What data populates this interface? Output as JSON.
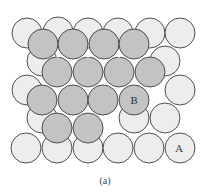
{
  "figure": {
    "caption": "(a)",
    "colors": {
      "layer_a_fill": "#ededed",
      "layer_b_fill": "#c3c3c3",
      "stroke": "#3c3c3c",
      "hole": "#ffffff"
    },
    "radius": 15,
    "layer_a": {
      "name": "Layer A (bottom, light)",
      "circles": [
        [
          27,
          33
        ],
        [
          58,
          32
        ],
        [
          88,
          33
        ],
        [
          118,
          33
        ],
        [
          150,
          33
        ],
        [
          180,
          33
        ],
        [
          42,
          61
        ],
        [
          165,
          61
        ],
        [
          27,
          90
        ],
        [
          180,
          90
        ],
        [
          42,
          118
        ],
        [
          134,
          118
        ],
        [
          165,
          118
        ],
        [
          26,
          148
        ],
        [
          57,
          148
        ],
        [
          88,
          148
        ],
        [
          118,
          148
        ],
        [
          149,
          148
        ],
        [
          180,
          148
        ]
      ],
      "label": {
        "text": "A",
        "x": 179,
        "y": 152
      }
    },
    "layer_b": {
      "name": "Layer B (top, dark)",
      "circles": [
        [
          43,
          44
        ],
        [
          73,
          44
        ],
        [
          104,
          44
        ],
        [
          134,
          44
        ],
        [
          57,
          72
        ],
        [
          88,
          72
        ],
        [
          119,
          72
        ],
        [
          150,
          72
        ],
        [
          42,
          100
        ],
        [
          73,
          100
        ],
        [
          103,
          100
        ],
        [
          134,
          100
        ],
        [
          57,
          128
        ],
        [
          88,
          128
        ]
      ],
      "label": {
        "text": "B",
        "x": 134,
        "y": 104
      }
    },
    "holes": [
      [
        58,
        56
      ],
      [
        88,
        56
      ],
      [
        119,
        56
      ],
      [
        73,
        81
      ],
      [
        103,
        81
      ],
      [
        134,
        81
      ],
      [
        58,
        110
      ],
      [
        88,
        110
      ]
    ]
  }
}
